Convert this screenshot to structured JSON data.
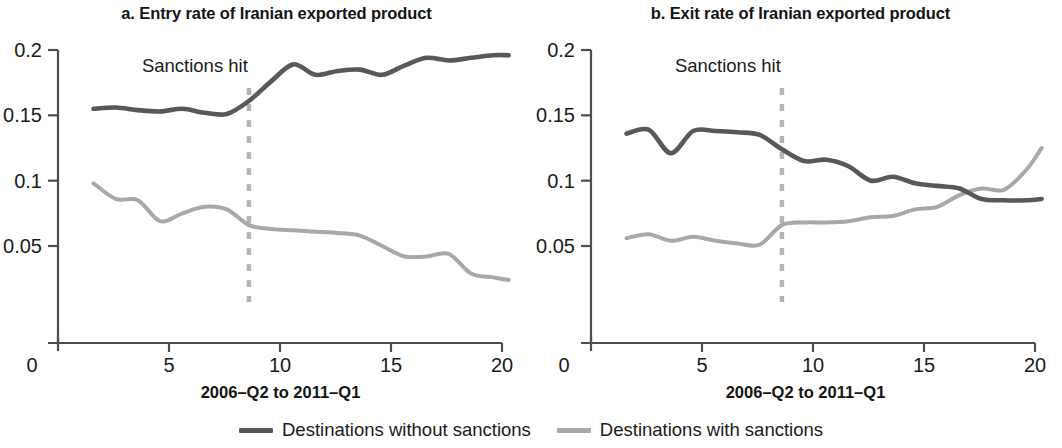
{
  "figure": {
    "background": "#ffffff"
  },
  "legend": {
    "position": "bottom-center",
    "items": [
      {
        "label": "Destinations without sanctions",
        "color": "#585858",
        "series_key": "without_sanctions"
      },
      {
        "label": "Destinations with sanctions",
        "color": "#a8a8a8",
        "series_key": "with_sanctions"
      }
    ]
  },
  "panels": [
    {
      "id": "a",
      "title": "a. Entry rate of Iranian exported product",
      "xlabel": "2006–Q2 to 2011–Q1",
      "ylabel": "",
      "yticks": [
        "0.2",
        "0.15",
        "0.1",
        "0.05",
        "0"
      ],
      "xticks": [
        "0",
        "5",
        "10",
        "15",
        "20"
      ],
      "annotation": "Sanctions hit"
    },
    {
      "id": "b",
      "title": "b. Exit rate of Iranian exported product",
      "xlabel": "2006–Q2 to 2011–Q1",
      "ylabel": "",
      "yticks": [
        "0.2",
        "0.15",
        "0.1",
        "0.05",
        "0"
      ],
      "xticks": [
        "0",
        "5",
        "10",
        "15",
        "20"
      ],
      "annotation": "Sanctions hit"
    }
  ],
  "chart_data": [
    {
      "type": "line",
      "panel": "a",
      "title": "a. Entry rate of Iranian exported product",
      "xlabel": "2006–Q2 to 2011–Q1",
      "ylabel": "",
      "xlim": [
        0,
        20.5
      ],
      "ylim": [
        0,
        0.205
      ],
      "xticks": [
        0,
        5,
        10,
        15,
        20
      ],
      "yticks": [
        0,
        0.05,
        0.1,
        0.15,
        0.2
      ],
      "ytick_labels": [
        "0",
        "0.05",
        "0.1",
        "0.15",
        "0.2"
      ],
      "grid": false,
      "legend": "bottom-center",
      "annotations": [
        {
          "text": "Sanctions hit",
          "x": 8.6,
          "type": "vertical-dashed-line",
          "color": "#b4b4b4"
        }
      ],
      "x": [
        1.6,
        2.6,
        3.6,
        4.6,
        5.6,
        6.6,
        7.6,
        8.6,
        9.6,
        10.6,
        11.6,
        12.6,
        13.6,
        14.6,
        15.6,
        16.6,
        17.6,
        18.6,
        19.6,
        20.3
      ],
      "series": [
        {
          "name": "Destinations without sanctions",
          "color": "#585858",
          "values": [
            0.155,
            0.156,
            0.154,
            0.153,
            0.155,
            0.152,
            0.151,
            0.161,
            0.176,
            0.189,
            0.181,
            0.184,
            0.185,
            0.181,
            0.188,
            0.194,
            0.192,
            0.194,
            0.196,
            0.196
          ]
        },
        {
          "name": "Destinations with sanctions",
          "color": "#a8a8a8",
          "values": [
            0.098,
            0.086,
            0.085,
            0.069,
            0.075,
            0.08,
            0.078,
            0.066,
            0.063,
            0.062,
            0.061,
            0.06,
            0.058,
            0.05,
            0.042,
            0.042,
            0.044,
            0.029,
            0.026,
            0.024
          ]
        }
      ]
    },
    {
      "type": "line",
      "panel": "b",
      "title": "b. Exit rate of Iranian exported product",
      "xlabel": "2006–Q2 to 2011–Q1",
      "ylabel": "",
      "xlim": [
        0,
        20.5
      ],
      "ylim": [
        0,
        0.205
      ],
      "xticks": [
        0,
        5,
        10,
        15,
        20
      ],
      "yticks": [
        0,
        0.05,
        0.1,
        0.15,
        0.2
      ],
      "ytick_labels": [
        "0",
        "0.05",
        "0.1",
        "0.15",
        "0.2"
      ],
      "grid": false,
      "legend": "bottom-center",
      "annotations": [
        {
          "text": "Sanctions hit",
          "x": 8.6,
          "type": "vertical-dashed-line",
          "color": "#b4b4b4"
        }
      ],
      "x": [
        1.6,
        2.6,
        3.6,
        4.6,
        5.6,
        6.6,
        7.6,
        8.6,
        9.6,
        10.6,
        11.6,
        12.6,
        13.6,
        14.6,
        15.6,
        16.6,
        17.6,
        18.6,
        19.6,
        20.3
      ],
      "series": [
        {
          "name": "Destinations without sanctions",
          "color": "#585858",
          "values": [
            0.136,
            0.139,
            0.121,
            0.138,
            0.138,
            0.137,
            0.135,
            0.124,
            0.115,
            0.116,
            0.111,
            0.1,
            0.103,
            0.098,
            0.096,
            0.094,
            0.086,
            0.085,
            0.085,
            0.086
          ]
        },
        {
          "name": "Destinations with sanctions",
          "color": "#a8a8a8",
          "values": [
            0.056,
            0.059,
            0.054,
            0.057,
            0.054,
            0.052,
            0.051,
            0.066,
            0.068,
            0.068,
            0.069,
            0.072,
            0.073,
            0.078,
            0.08,
            0.089,
            0.094,
            0.093,
            0.108,
            0.125
          ]
        }
      ]
    }
  ]
}
